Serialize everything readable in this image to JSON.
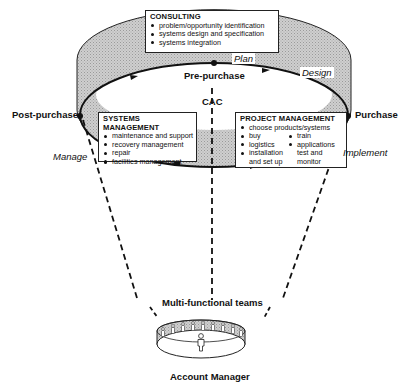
{
  "diagram": {
    "colors": {
      "band_fill": "#c9c9c9",
      "line": "#111111",
      "background": "#ffffff"
    },
    "nodes": {
      "pre_purchase": "Pre-purchase",
      "post_purchase": "Post-purchase",
      "purchase": "Purchase",
      "center": "CAC"
    },
    "phases": {
      "plan": "Plan",
      "design": "Design",
      "implement": "Implement",
      "manage": "Manage"
    },
    "consulting": {
      "title": "CONSULTING",
      "items": [
        "problem/opportunity identification",
        "systems design and specification",
        "systems integration"
      ]
    },
    "systems_management": {
      "title": "SYSTEMS MANAGEMENT",
      "items": [
        "maintenance and support",
        "recovery management",
        "repair",
        "facilities management"
      ]
    },
    "project_management": {
      "title": "PROJECT MANAGEMENT",
      "top_item": "choose products/systems",
      "left_items": [
        "buy",
        "logistics",
        "installation",
        "and set up"
      ],
      "right_items": [
        "train",
        "applications",
        "test and",
        "monitor"
      ]
    },
    "bottom": {
      "teams_label": "Multi-functional teams",
      "manager_label": "Account Manager"
    }
  }
}
